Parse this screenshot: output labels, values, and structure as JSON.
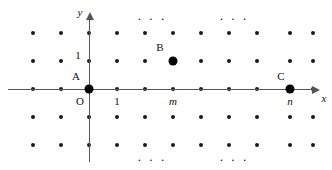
{
  "figure": {
    "background_color": "#ffffff",
    "dot_color": "#1a1a1a",
    "axis_color": "#555555",
    "width": 332,
    "height": 170
  },
  "axes": {
    "x_label": "x",
    "y_label": "y",
    "origin_label": "O",
    "x_unit_label": "1",
    "y_unit_label": "1",
    "x_axis_y": 89,
    "y_axis_x": 89,
    "x_tick_m": "m",
    "x_tick_n": "n"
  },
  "points": [
    {
      "name": "A",
      "label": "A",
      "x": 89,
      "y": 89,
      "label_x": 76,
      "label_y": 76
    },
    {
      "name": "B",
      "label": "B",
      "x": 173,
      "y": 61,
      "label_x": 160,
      "label_y": 47
    },
    {
      "name": "C",
      "label": "C",
      "x": 290,
      "y": 89,
      "label_x": 281,
      "label_y": 76
    }
  ],
  "tick_labels": [
    {
      "text": "1",
      "x": 78,
      "y": 55
    },
    {
      "text": "O",
      "x": 80,
      "y": 101
    },
    {
      "text": "1",
      "x": 117,
      "y": 101
    },
    {
      "text": "m",
      "x": 173,
      "y": 101,
      "italic": true
    },
    {
      "text": "n",
      "x": 290,
      "y": 101,
      "italic": true
    }
  ],
  "ellipses": [
    {
      "text": "· · ·",
      "x": 152,
      "y": 18
    },
    {
      "text": "· · ·",
      "x": 234,
      "y": 18
    },
    {
      "text": "· · ·",
      "x": 152,
      "y": 159
    },
    {
      "text": "· · ·",
      "x": 234,
      "y": 159
    }
  ],
  "grid": {
    "columns_x": [
      33,
      61,
      89,
      117,
      145,
      173,
      201,
      229,
      257,
      290,
      313
    ],
    "rows_y": [
      33,
      61,
      89,
      117,
      145
    ],
    "dot_radius": 2,
    "note": "lattice points of the integer grid"
  }
}
